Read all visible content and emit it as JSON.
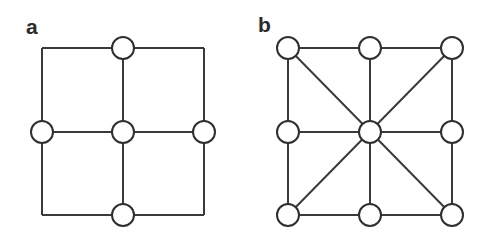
{
  "figure": {
    "background_color": "#ffffff",
    "line_color": "#3a3a3a",
    "node_stroke_color": "#2f2f2f",
    "node_fill_color": "#ffffff",
    "label_color": "#2b2b2b",
    "width": 481,
    "height": 239
  },
  "panels": [
    {
      "id": "a",
      "label": "a",
      "connectivity": 4,
      "node_count": 5,
      "node_radius": 11,
      "square": {
        "left": 42,
        "top": 48,
        "right": 204,
        "bottom": 215
      },
      "nodes": [
        {
          "name": "center",
          "cx": 123,
          "cy": 132
        },
        {
          "name": "top",
          "cx": 123,
          "cy": 48
        },
        {
          "name": "bottom",
          "cx": 123,
          "cy": 215
        },
        {
          "name": "left",
          "cx": 42,
          "cy": 132
        },
        {
          "name": "right",
          "cx": 204,
          "cy": 132
        }
      ],
      "edges": [
        {
          "name": "square-top",
          "x1": 42,
          "y1": 48,
          "x2": 204,
          "y2": 48
        },
        {
          "name": "square-right",
          "x1": 204,
          "y1": 48,
          "x2": 204,
          "y2": 215
        },
        {
          "name": "square-bottom",
          "x1": 42,
          "y1": 215,
          "x2": 204,
          "y2": 215
        },
        {
          "name": "square-left",
          "x1": 42,
          "y1": 48,
          "x2": 42,
          "y2": 215
        },
        {
          "name": "cross-vertical",
          "x1": 123,
          "y1": 48,
          "x2": 123,
          "y2": 215
        },
        {
          "name": "cross-horizontal",
          "x1": 42,
          "y1": 132,
          "x2": 204,
          "y2": 132
        }
      ]
    },
    {
      "id": "b",
      "label": "b",
      "connectivity": 8,
      "node_count": 9,
      "node_radius": 11,
      "square": {
        "left": 48,
        "top": 48,
        "right": 212,
        "bottom": 215
      },
      "nodes": [
        {
          "name": "center",
          "cx": 130,
          "cy": 132
        },
        {
          "name": "top",
          "cx": 130,
          "cy": 48
        },
        {
          "name": "bottom",
          "cx": 130,
          "cy": 215
        },
        {
          "name": "left",
          "cx": 48,
          "cy": 132
        },
        {
          "name": "right",
          "cx": 212,
          "cy": 132
        },
        {
          "name": "top-left",
          "cx": 48,
          "cy": 48
        },
        {
          "name": "top-right",
          "cx": 212,
          "cy": 48
        },
        {
          "name": "bottom-left",
          "cx": 48,
          "cy": 215
        },
        {
          "name": "bottom-right",
          "cx": 212,
          "cy": 215
        }
      ],
      "edges": [
        {
          "name": "square-top",
          "x1": 48,
          "y1": 48,
          "x2": 212,
          "y2": 48
        },
        {
          "name": "square-right",
          "x1": 212,
          "y1": 48,
          "x2": 212,
          "y2": 215
        },
        {
          "name": "square-bottom",
          "x1": 48,
          "y1": 215,
          "x2": 212,
          "y2": 215
        },
        {
          "name": "square-left",
          "x1": 48,
          "y1": 48,
          "x2": 48,
          "y2": 215
        },
        {
          "name": "cross-vertical",
          "x1": 130,
          "y1": 48,
          "x2": 130,
          "y2": 215
        },
        {
          "name": "cross-horizontal",
          "x1": 48,
          "y1": 132,
          "x2": 212,
          "y2": 132
        },
        {
          "name": "diagonal-nw-se",
          "x1": 48,
          "y1": 48,
          "x2": 212,
          "y2": 215
        },
        {
          "name": "diagonal-ne-sw",
          "x1": 212,
          "y1": 48,
          "x2": 48,
          "y2": 215
        }
      ]
    }
  ]
}
